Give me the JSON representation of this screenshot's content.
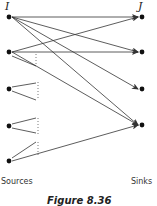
{
  "diagram": {
    "source_set_label": "I",
    "sink_set_label": "J",
    "sources_label": "Sources",
    "sinks_label": "Sinks",
    "caption": "Figure 8.36",
    "colors": {
      "node": "#111111",
      "edge": "#333333"
    },
    "sources": [
      {
        "id": "s1",
        "x": 9,
        "y": 17
      },
      {
        "id": "s2",
        "x": 9,
        "y": 52
      },
      {
        "id": "s3",
        "x": 9,
        "y": 89
      },
      {
        "id": "s4",
        "x": 9,
        "y": 126
      },
      {
        "id": "s5",
        "x": 9,
        "y": 161
      }
    ],
    "sinks": [
      {
        "id": "t1",
        "x": 142,
        "y": 17
      },
      {
        "id": "t2",
        "x": 142,
        "y": 52
      },
      {
        "id": "t3",
        "x": 142,
        "y": 89
      },
      {
        "id": "t4",
        "x": 142,
        "y": 125
      }
    ],
    "edges": [
      {
        "from": "s1",
        "to": "t1"
      },
      {
        "from": "s1",
        "to": "t2"
      },
      {
        "from": "s1",
        "to": "t3"
      },
      {
        "from": "s1",
        "to": "t4"
      },
      {
        "from": "s2",
        "to": "t1"
      },
      {
        "from": "s2",
        "to": "t2"
      },
      {
        "from": "s2",
        "to": "t4"
      },
      {
        "from": "s5",
        "to": "t4"
      }
    ]
  }
}
